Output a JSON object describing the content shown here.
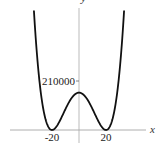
{
  "chart_data": {
    "type": "line",
    "title": "",
    "function": "y = (x^2 - 400)^2",
    "xlabel": "x",
    "ylabel": "y",
    "xlim": [
      -36,
      36
    ],
    "ylim": [
      -20000,
      560000
    ],
    "grid": false,
    "legend": null,
    "x_ticks": [
      {
        "value": -20,
        "label": "-20"
      },
      {
        "value": 20,
        "label": "20"
      }
    ],
    "y_ticks": [
      {
        "value": 210000,
        "label": "210000"
      }
    ],
    "key_points": [
      {
        "x": -20,
        "y": 0,
        "note": "local minimum"
      },
      {
        "x": 0,
        "y": 160000,
        "note": "local maximum"
      },
      {
        "x": 20,
        "y": 0,
        "note": "local minimum"
      }
    ],
    "x": [
      -33.4,
      -30,
      -26,
      -22,
      -20,
      -18,
      -14,
      -10,
      -6,
      0,
      6,
      10,
      14,
      18,
      20,
      22,
      26,
      30,
      33.4
    ],
    "values": [
      509000,
      250000,
      76176,
      7056,
      0,
      5776,
      41616,
      90000,
      132496,
      160000,
      132496,
      90000,
      41616,
      5776,
      0,
      7056,
      76176,
      250000,
      509000
    ],
    "colors": {
      "curve": "#111111",
      "axes": "#999999"
    }
  }
}
